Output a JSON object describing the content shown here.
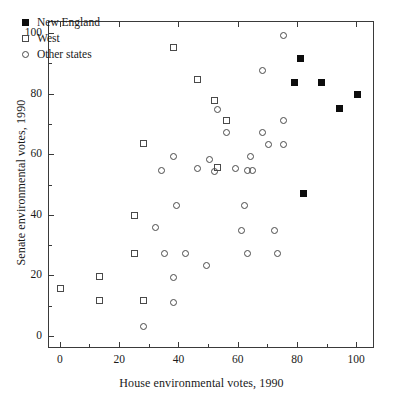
{
  "chart_data": {
    "type": "scatter",
    "title": "",
    "xlabel": "House environmental votes, 1990",
    "ylabel": "Senate environmental votes, 1990",
    "xlim": [
      -4,
      106
    ],
    "ylim": [
      -4,
      104
    ],
    "xticks": [
      0,
      20,
      40,
      60,
      80,
      100
    ],
    "xticks_minor": [
      10,
      30,
      50,
      70,
      90
    ],
    "yticks": [
      0,
      20,
      40,
      60,
      80,
      100
    ],
    "yticks_minor": [
      10,
      30,
      50,
      70,
      90
    ],
    "xtick_labels": [
      "0",
      "20",
      "40",
      "60",
      "80",
      "100"
    ],
    "ytick_labels": [
      "0",
      "20",
      "40",
      "60",
      "80",
      "100"
    ],
    "grid": false,
    "legend_position": "top-left",
    "series": [
      {
        "name": "New England",
        "marker": "filled-square",
        "color": "#0d0d0d",
        "points": [
          [
            79,
            84
          ],
          [
            81,
            92
          ],
          [
            82,
            47.5
          ],
          [
            88,
            84
          ],
          [
            94,
            75.5
          ],
          [
            100,
            80
          ]
        ]
      },
      {
        "name": "West",
        "marker": "open-square",
        "color": "#4a4a4a",
        "points": [
          [
            0,
            16
          ],
          [
            13,
            20
          ],
          [
            13,
            12
          ],
          [
            25,
            27.5
          ],
          [
            25,
            40
          ],
          [
            28,
            12
          ],
          [
            28,
            64
          ],
          [
            38,
            95.5
          ],
          [
            46,
            85
          ],
          [
            52,
            78
          ],
          [
            53,
            56
          ],
          [
            56,
            71.5
          ]
        ]
      },
      {
        "name": "Other states",
        "marker": "open-circle",
        "color": "#4a4a4a",
        "points": [
          [
            28,
            3.5
          ],
          [
            32,
            36
          ],
          [
            34,
            55
          ],
          [
            35,
            27.5
          ],
          [
            38,
            11.5
          ],
          [
            38,
            19.5
          ],
          [
            38,
            59.5
          ],
          [
            39,
            43.5
          ],
          [
            42,
            27.5
          ],
          [
            46,
            55.5
          ],
          [
            49,
            23.5
          ],
          [
            50,
            58.5
          ],
          [
            52,
            54.5
          ],
          [
            53,
            75
          ],
          [
            56,
            67.5
          ],
          [
            59,
            55.5
          ],
          [
            61,
            35
          ],
          [
            62,
            43.5
          ],
          [
            63,
            27.5
          ],
          [
            63,
            55
          ],
          [
            64,
            59.5
          ],
          [
            64.5,
            55
          ],
          [
            68,
            67.5
          ],
          [
            68,
            88
          ],
          [
            70,
            63.5
          ],
          [
            72,
            35
          ],
          [
            73,
            27.5
          ],
          [
            75,
            63.5
          ],
          [
            75,
            71.5
          ],
          [
            75,
            99.5
          ]
        ]
      }
    ]
  },
  "legend": {
    "entries": [
      {
        "label": "New England",
        "marker": "filled-square"
      },
      {
        "label": "West",
        "marker": "open-square"
      },
      {
        "label": "Other states",
        "marker": "open-circle"
      }
    ]
  }
}
